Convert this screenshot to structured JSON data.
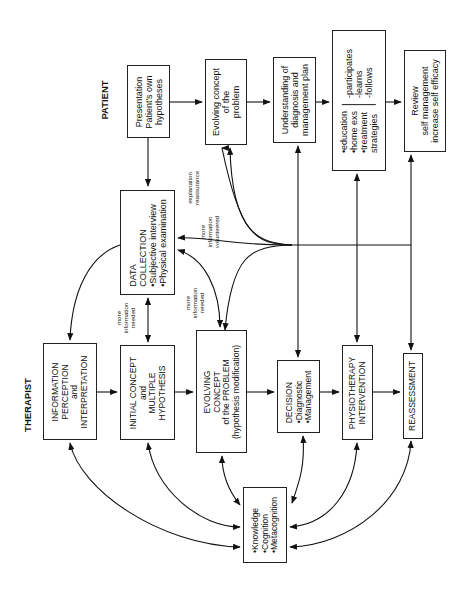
{
  "labels": {
    "patient": "PATIENT",
    "therapist": "THERAPIST"
  },
  "patient_boxes": {
    "presentation": [
      "Presentation",
      "Patient's own",
      "hypotheses"
    ],
    "evolving_concept": [
      "Evolving concept",
      "of the",
      "problem"
    ],
    "understanding": [
      "Understanding of",
      "diagnosis and",
      "management plan"
    ],
    "participation": {
      "left": [
        "•education",
        "•home exs",
        "•treatment",
        "strategies"
      ],
      "right": [
        "-participates",
        "-learns",
        "-follows"
      ]
    },
    "review": [
      "Review",
      "self management",
      "increase self efficacy"
    ]
  },
  "therapist_boxes": {
    "data_collection": [
      "DATA",
      "COLLECTION",
      "•Subjective interview",
      "•Physical examination"
    ],
    "information": [
      "INFORMATION",
      "PERCEPTION",
      "and",
      "INTERPRETATION"
    ],
    "initial_concept": [
      "INITIAL CONCEPT",
      "and",
      "MULTIPLE",
      "HYPOTHESIS"
    ],
    "evolving_concept": [
      "EVOLVING",
      "CONCEPT",
      "of the  PROBLEM",
      "(hypothesis modification)"
    ],
    "decision": [
      "DECISION",
      "•Diagnostic",
      "•Management"
    ],
    "physiotherapy": [
      "PHYSIOTHERAPY",
      "INTERVENTION"
    ],
    "reassessment": [
      "REASSESSMENT"
    ],
    "knowledge": [
      "•Knowledge",
      "•Cognition",
      "•Metacognition"
    ]
  },
  "annotations": {
    "explanation": [
      "explanation",
      "reassurance"
    ],
    "more_info_volunteered": [
      "more",
      "information",
      "volunteered"
    ],
    "more_info_needed_1": [
      "more",
      "information",
      "needed"
    ],
    "more_info_needed_2": [
      "more",
      "information",
      "needed"
    ]
  }
}
